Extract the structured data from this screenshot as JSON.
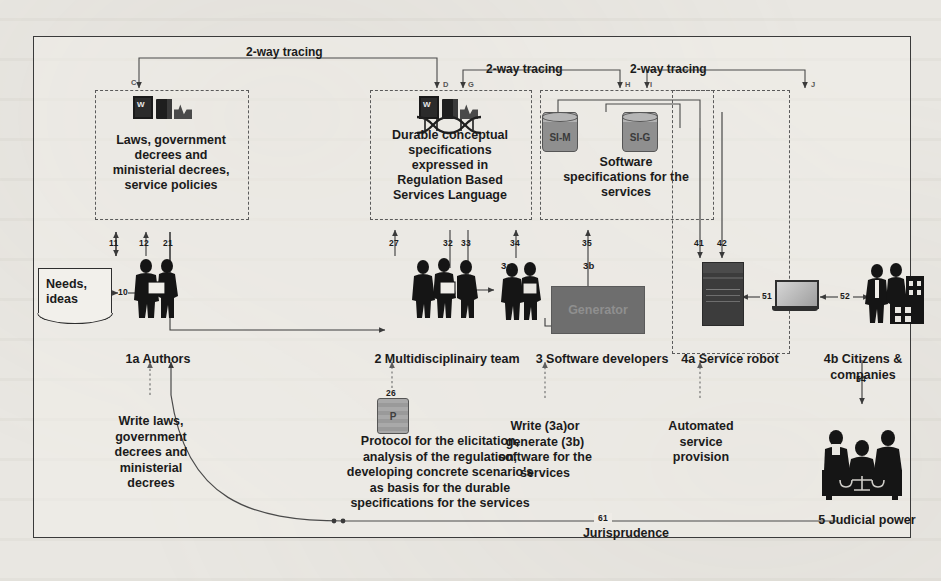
{
  "figure": {
    "frame_border_color": "#3a3a3a",
    "background_color": "#e9e7e2"
  },
  "tracing_labels": [
    {
      "id": "t1",
      "text": "2-way tracing"
    },
    {
      "id": "t2",
      "text": "2-way tracing"
    },
    {
      "id": "t3",
      "text": "2-way tracing"
    }
  ],
  "letter_markers": [
    "C",
    "D",
    "G",
    "H",
    "I",
    "J"
  ],
  "artifact_boxes": [
    {
      "id": "laws",
      "text": "Laws, government decrees and ministerial decrees, service policies",
      "lines": [
        "Laws, government",
        "decrees and",
        "ministerial decrees,",
        "service policies"
      ],
      "icons": [
        "word-document-icon",
        "black-book-icon",
        "xml-file-icon"
      ]
    },
    {
      "id": "specs",
      "text": "Durable conceptual specifications expressed in Regulation Based Services Language",
      "lines": [
        "Durable conceptual",
        "specifications",
        "expressed in",
        "Regulation Based",
        "Services Language"
      ],
      "icons": [
        "word-document-icon",
        "black-book-icon",
        "xml-file-icon",
        "dna-helix-icon"
      ]
    },
    {
      "id": "software-specs",
      "text": "Software specifications for the services",
      "lines": [
        "Software",
        "specifications for the",
        "services"
      ],
      "cylinders": [
        {
          "label": "SI-M"
        },
        {
          "label": "SI-G"
        }
      ]
    }
  ],
  "actors": [
    {
      "id": "authors",
      "label": "1a Authors",
      "icon": "two-people-icon"
    },
    {
      "id": "multidisciplinary",
      "label": "2 Multidisciplinairy team",
      "icon": "three-people-icon"
    },
    {
      "id": "developers",
      "label": "3 Software developers",
      "icon": "two-developers-icon"
    },
    {
      "id": "robot",
      "label": "4a Service robot",
      "icon": "server-tower-icon"
    },
    {
      "id": "citizens",
      "label": "4b Citizens & companies",
      "icon": "people-buildings-icon"
    },
    {
      "id": "judicial",
      "label": "5 Judicial power",
      "icon": "judges-with-scales-icon"
    }
  ],
  "input_note": {
    "id": "needs",
    "lines": [
      "Needs,",
      "ideas"
    ],
    "text": "Needs, ideas"
  },
  "generator": {
    "label": "Generator"
  },
  "branch_labels": [
    {
      "id": "3a",
      "text": "3a"
    },
    {
      "id": "3b",
      "text": "3b"
    }
  ],
  "annotations": [
    {
      "id": "write-laws",
      "lines": [
        "Write laws,",
        "government",
        "decrees and",
        "ministerial",
        "decrees"
      ],
      "text": "Write laws, government decrees and ministerial decrees"
    },
    {
      "id": "protocol",
      "lines": [
        "Protocol for the elicitation,",
        "analysis of the regulation,",
        "developing concrete scenario's",
        "as basis for the durable",
        "specifications for the services"
      ],
      "text": "Protocol for the elicitation, analysis of the regulation, developing concrete scenario's as basis for the durable specifications for the services",
      "icon": {
        "label": "P",
        "name": "protocol-cylinder-icon"
      }
    },
    {
      "id": "write-or-generate",
      "lines": [
        "Write (3a)or",
        "generate (3b)",
        "software for the",
        "services"
      ],
      "text": "Write (3a)or generate (3b) software for the services"
    },
    {
      "id": "automated-service",
      "lines": [
        "Automated",
        "service",
        "provision"
      ],
      "text": "Automated service provision"
    },
    {
      "id": "jurisprudence",
      "lines": [
        "Jurisprudence"
      ],
      "text": "Jurisprudence"
    }
  ],
  "flow_numbers": [
    {
      "id": "n10",
      "value": "10"
    },
    {
      "id": "n11",
      "value": "11"
    },
    {
      "id": "n12",
      "value": "12"
    },
    {
      "id": "n21",
      "value": "21"
    },
    {
      "id": "n26",
      "value": "26"
    },
    {
      "id": "n27",
      "value": "27"
    },
    {
      "id": "n32",
      "value": "32"
    },
    {
      "id": "n33",
      "value": "33"
    },
    {
      "id": "n34",
      "value": "34"
    },
    {
      "id": "n35",
      "value": "35"
    },
    {
      "id": "n41",
      "value": "41"
    },
    {
      "id": "n42",
      "value": "42"
    },
    {
      "id": "n51",
      "value": "51"
    },
    {
      "id": "n52",
      "value": "52"
    },
    {
      "id": "n54",
      "value": "54"
    },
    {
      "id": "n61",
      "value": "61"
    }
  ]
}
